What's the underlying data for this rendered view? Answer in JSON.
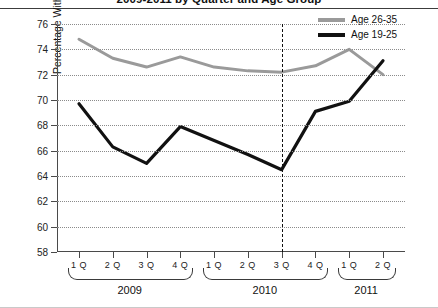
{
  "title": "2009-2011 by Quarter and Age Group",
  "legend": {
    "position": "top-right",
    "items": [
      {
        "label": "Age 26-35",
        "color": "#9a9a9a"
      },
      {
        "label": "Age 19-25",
        "color": "#111111"
      }
    ]
  },
  "axes": {
    "ylabel": "Percentage With Health Insurance",
    "yticks": [
      58,
      60,
      62,
      64,
      66,
      68,
      70,
      72,
      74,
      76
    ],
    "ylim": [
      58,
      76
    ],
    "xticklabels": [
      "1 Q",
      "2 Q",
      "3 Q",
      "4 Q",
      "1 Q",
      "2 Q",
      "3 Q",
      "4 Q",
      "1 Q",
      "2 Q"
    ],
    "year_groups": [
      {
        "label": "2009",
        "start": 0,
        "end": 3
      },
      {
        "label": "2010",
        "start": 4,
        "end": 7
      },
      {
        "label": "2011",
        "start": 8,
        "end": 9
      }
    ]
  },
  "annotations": {
    "divider_at_index": 6,
    "divider_style": "dashed-vertical"
  },
  "chart_data": {
    "type": "line",
    "title": "2009-2011 by Quarter and Age Group",
    "xlabel": "",
    "ylabel": "Percentage With Health Insurance",
    "ylim": [
      58,
      76
    ],
    "grid": true,
    "legend_position": "top-right",
    "categories": [
      "2009 1Q",
      "2009 2Q",
      "2009 3Q",
      "2009 4Q",
      "2010 1Q",
      "2010 2Q",
      "2010 3Q",
      "2010 4Q",
      "2011 1Q",
      "2011 2Q"
    ],
    "series": [
      {
        "name": "Age 26-35",
        "color": "#9a9a9a",
        "values": [
          74.8,
          73.3,
          72.6,
          73.4,
          72.6,
          72.3,
          72.2,
          72.7,
          74.0,
          72.0
        ]
      },
      {
        "name": "Age 19-25",
        "color": "#111111",
        "values": [
          69.7,
          66.3,
          65.0,
          67.9,
          66.8,
          65.7,
          64.5,
          69.1,
          69.9,
          73.1
        ]
      }
    ]
  }
}
